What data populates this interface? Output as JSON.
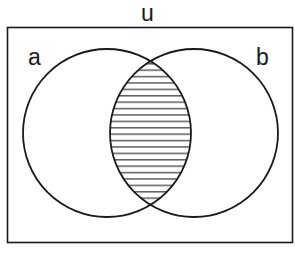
{
  "diagram": {
    "type": "venn",
    "universe_label": "u",
    "sets": [
      {
        "label": "a"
      },
      {
        "label": "b"
      }
    ],
    "shaded_region": "a ∩ b",
    "shading_style": "horizontal-hatch",
    "colors": {
      "stroke": "#1a1a1a",
      "background": "#ffffff",
      "hatch": "#2a2a2a"
    }
  }
}
